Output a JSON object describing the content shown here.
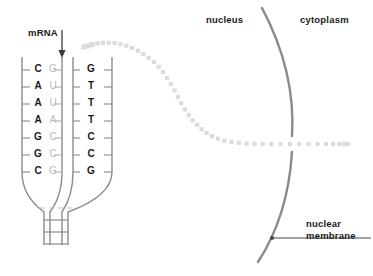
{
  "figure": {
    "background_color": "#ffffff"
  },
  "labels": {
    "mrna": "mRNA",
    "nucleus": "nucleus",
    "cytoplasm": "cytoplasm",
    "nuclear_membrane_line1": "nuclear",
    "nuclear_membrane_line2": "membrane"
  },
  "colors": {
    "text_dark": "#1a1a1a",
    "base_faint": "#b9b9b9",
    "strand_line": "#8c8c8c",
    "membrane": "#8a8a8a",
    "mrna_dots": "#dcdcdc",
    "arrow": "#3a3a3a"
  },
  "dna": {
    "description": "Open transcription bubble with template strand bases (faint), mRNA transcript bases (bold left), and coding strand bases (bold right)",
    "rows": [
      {
        "mrna_base": "C",
        "template_base": "G",
        "coding_base": "G"
      },
      {
        "mrna_base": "A",
        "template_base": "U",
        "coding_base": "T"
      },
      {
        "mrna_base": "A",
        "template_base": "U",
        "coding_base": "T"
      },
      {
        "mrna_base": "A",
        "template_base": "A",
        "coding_base": "T"
      },
      {
        "mrna_base": "G",
        "template_base": "C",
        "coding_base": "C"
      },
      {
        "mrna_base": "G",
        "template_base": "C",
        "coding_base": "C"
      },
      {
        "mrna_base": "C",
        "template_base": "G",
        "coding_base": "G"
      }
    ],
    "helix_rungs": 3
  },
  "mrna_path": {
    "style": "dotted-square-trail",
    "dot_count": 46,
    "direction": "from transcription start, arcing right and down, then horizontally through nuclear membrane pore into cytoplasm"
  },
  "membrane": {
    "shape": "arc",
    "has_pore_gap": true,
    "pore_y": 143
  }
}
